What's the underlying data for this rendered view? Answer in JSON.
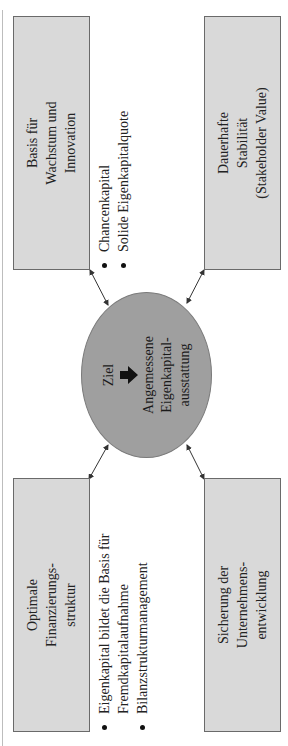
{
  "diagram": {
    "center": {
      "goal_label": "Ziel",
      "goal_icon": "arrow-down-icon",
      "goal_text": "Angemessene\nEigenkapital-\nausstattung",
      "fill_color": "#9f9f9f"
    },
    "boxes": {
      "top_left": "Optimale\nFinanzierungs-\nstruktur",
      "bottom_left": "Sicherung der\nUnternehmens-\nentwicklung",
      "top_right": "Basis für\nWachstum und\nInnovation",
      "bottom_right": "Dauerhafte\nStabilität\n(Stakeholder Value)",
      "fill_color": "#d9d9d9"
    },
    "bullets_left": [
      "Eigenkapital bildet die Basis für Fremdkapitalaufnahme",
      "Bilanzstrukturmanagement"
    ],
    "bullets_right": [
      "Chancenkapital",
      "Solide Eigenkapitalquote"
    ],
    "orientation": "rotated -90°"
  }
}
